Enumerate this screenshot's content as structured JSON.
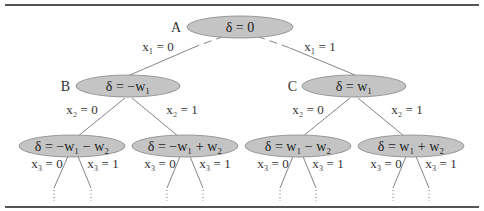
{
  "diagram": {
    "type": "decision-tree",
    "root": {
      "id": "A",
      "label": "A",
      "value": "δ = 0",
      "children_edges": [
        {
          "label": "x₁ = 0",
          "to": "B",
          "style": "dashed-then-solid"
        },
        {
          "label": "x₁ = 1",
          "to": "C",
          "style": "dashed-then-solid"
        }
      ]
    },
    "level1": [
      {
        "id": "B",
        "label": "B",
        "value": "δ = −w₁",
        "edges": [
          {
            "label": "x₂ = 0"
          },
          {
            "label": "x₂ = 1"
          }
        ]
      },
      {
        "id": "C",
        "label": "C",
        "value": "δ = w₁",
        "edges": [
          {
            "label": "x₂ = 0"
          },
          {
            "label": "x₂ = 1"
          }
        ]
      }
    ],
    "level2": [
      {
        "value": "δ = −w₁ − w₂",
        "edges": [
          {
            "label": "x₃ = 0"
          },
          {
            "label": "x₃ = 1"
          }
        ]
      },
      {
        "value": "δ = −w₁ + w₂",
        "edges": [
          {
            "label": "x₃ = 0"
          },
          {
            "label": "x₃ = 1"
          }
        ]
      },
      {
        "value": "δ = w₁ − w₂",
        "edges": [
          {
            "label": "x₃ = 0"
          },
          {
            "label": "x₃ = 1"
          }
        ]
      },
      {
        "value": "δ = w₁ + w₂",
        "edges": [
          {
            "label": "x₃ = 0"
          },
          {
            "label": "x₃ = 1"
          }
        ]
      }
    ],
    "continuation": "⋮",
    "colors": {
      "node_fill": "#c4c4c4",
      "node_stroke": "#888888",
      "edge": "#777777",
      "rule": "#555555"
    }
  }
}
